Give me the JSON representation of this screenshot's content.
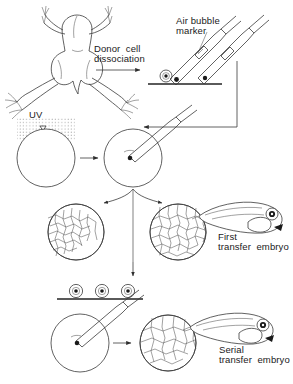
{
  "figure": {
    "kind": "scientific-diagram",
    "background_color": "#ffffff",
    "ink_color": "#3a3a3a"
  },
  "labels": {
    "air_bubble_marker": "Air bubble\nmarker",
    "donor_cell_dissociation": "Donor  cell\ndissociation",
    "uv": "UV",
    "first_transfer_embryo": "First\ntransfer  embryo",
    "serial_transfer_embryo": "Serial\ntransfer  embryo"
  },
  "elements": {
    "frog": "xenopus-frog-dorsal-view",
    "dish_top": "donor-cell-dish-with-single-cell",
    "pipette_loaded": "micropipette-with-air-bubble-and-cell",
    "pipette_second": "micropipette-with-cell",
    "uv_egg": "uv-irradiated-egg",
    "injected_egg": "egg-receiving-nuclear-injection",
    "blastula_partial": "partially-cleaved-blastula",
    "blastula_full": "fully-cleaved-blastula",
    "tadpole_first": "first-transfer-tadpole",
    "dish_second": "dish-with-three-dissociated-cells",
    "injected_egg_2": "egg-receiving-serial-injection",
    "blastula_second": "serial-transfer-blastula",
    "tadpole_serial": "serial-transfer-tadpole"
  },
  "arrows": {
    "dissociation": "frog-to-dish-horizontal-arrow",
    "uv_to_injection": "uv-egg-to-injected-egg-arrow",
    "pipette_feedback": "routed-arrow-from-pipettes-to-injection-pipette",
    "branch": "injected-egg-splits-to-two-blastulae",
    "to_tadpole": "blastula-to-first-transfer-embryo-arrow",
    "down_to_dish": "blastula-down-to-second-dish",
    "second_to_blastula": "injected-egg-to-serial-blastula-arrow",
    "to_serial_tadpole": "serial-blastula-to-serial-embryo-arrow"
  }
}
